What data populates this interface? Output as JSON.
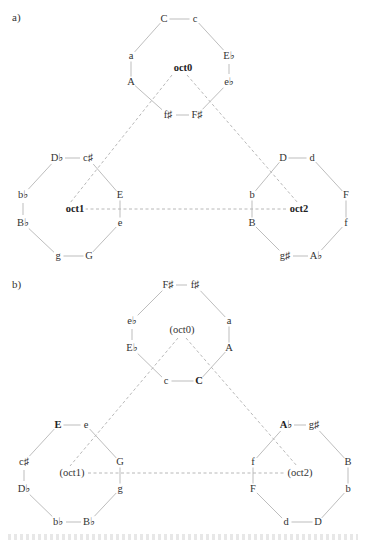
{
  "panels": [
    {
      "id": "a",
      "label": "a)",
      "label_pos": [
        12,
        18
      ],
      "hub_lines_dashed": true,
      "octagons": [
        {
          "name": "oct0",
          "center_label": "oct0",
          "center_bold": true,
          "center": [
            183,
            68
          ],
          "nodes": [
            {
              "t": "C",
              "x": 164,
              "y": 19,
              "bold": false
            },
            {
              "t": "c",
              "x": 195,
              "y": 19,
              "bold": false
            },
            {
              "t": "E♭",
              "x": 229,
              "y": 56,
              "bold": false
            },
            {
              "t": "e♭",
              "x": 229,
              "y": 82,
              "bold": false
            },
            {
              "t": "F♯",
              "x": 197,
              "y": 115,
              "bold": false
            },
            {
              "t": "f♯",
              "x": 168,
              "y": 115,
              "bold": false
            },
            {
              "t": "A",
              "x": 131,
              "y": 82,
              "bold": false
            },
            {
              "t": "a",
              "x": 131,
              "y": 56,
              "bold": false
            }
          ]
        },
        {
          "name": "oct1",
          "center_label": "oct1",
          "center_bold": true,
          "center": [
            75,
            209
          ],
          "nodes": [
            {
              "t": "D♭",
              "x": 57,
              "y": 158,
              "bold": false
            },
            {
              "t": "c♯",
              "x": 88,
              "y": 158,
              "bold": false
            },
            {
              "t": "E",
              "x": 120,
              "y": 195,
              "bold": false
            },
            {
              "t": "e",
              "x": 120,
              "y": 223,
              "bold": false
            },
            {
              "t": "G",
              "x": 89,
              "y": 256,
              "bold": false
            },
            {
              "t": "g",
              "x": 58,
              "y": 256,
              "bold": false
            },
            {
              "t": "B♭",
              "x": 23,
              "y": 223,
              "bold": false
            },
            {
              "t": "b♭",
              "x": 23,
              "y": 195,
              "bold": false
            }
          ]
        },
        {
          "name": "oct2",
          "center_label": "oct2",
          "center_bold": true,
          "center": [
            299,
            209
          ],
          "nodes": [
            {
              "t": "D",
              "x": 283,
              "y": 158,
              "bold": false
            },
            {
              "t": "d",
              "x": 312,
              "y": 158,
              "bold": false
            },
            {
              "t": "F",
              "x": 346,
              "y": 195,
              "bold": false
            },
            {
              "t": "f",
              "x": 346,
              "y": 223,
              "bold": false
            },
            {
              "t": "A♭",
              "x": 316,
              "y": 256,
              "bold": false
            },
            {
              "t": "g♯",
              "x": 285,
              "y": 256,
              "bold": false
            },
            {
              "t": "B",
              "x": 252,
              "y": 223,
              "bold": false
            },
            {
              "t": "b",
              "x": 252,
              "y": 195,
              "bold": false
            }
          ]
        }
      ],
      "dashed_links": [
        {
          "from": [
            172,
            75
          ],
          "to": [
            70,
            203
          ]
        },
        {
          "from": [
            187,
            75
          ],
          "to": [
            298,
            203
          ]
        },
        {
          "from": [
            85,
            209
          ],
          "to": [
            286,
            209
          ]
        }
      ]
    },
    {
      "id": "b",
      "label": "b)",
      "label_pos": [
        12,
        285
      ],
      "hub_lines_dashed": true,
      "octagons": [
        {
          "name": "oct0",
          "center_label": "(oct0)",
          "center_bold": false,
          "center": [
            182,
            330
          ],
          "nodes": [
            {
              "t": "F♯",
              "x": 168,
              "y": 285,
              "bold": false
            },
            {
              "t": "f♯",
              "x": 195,
              "y": 285,
              "bold": false
            },
            {
              "t": "a",
              "x": 229,
              "y": 321,
              "bold": false
            },
            {
              "t": "A",
              "x": 229,
              "y": 348,
              "bold": false
            },
            {
              "t": "C",
              "x": 199,
              "y": 381,
              "bold": true
            },
            {
              "t": "c",
              "x": 166,
              "y": 381,
              "bold": false
            },
            {
              "t": "E♭",
              "x": 132,
              "y": 348,
              "bold": false
            },
            {
              "t": "e♭",
              "x": 132,
              "y": 321,
              "bold": false
            }
          ]
        },
        {
          "name": "oct1",
          "center_label": "(oct1)",
          "center_bold": false,
          "center": [
            72,
            473
          ],
          "nodes": [
            {
              "t": "E",
              "x": 58,
              "y": 425,
              "bold": true
            },
            {
              "t": "e",
              "x": 86,
              "y": 425,
              "bold": false
            },
            {
              "t": "G",
              "x": 120,
              "y": 462,
              "bold": false
            },
            {
              "t": "g",
              "x": 120,
              "y": 489,
              "bold": false
            },
            {
              "t": "B♭",
              "x": 89,
              "y": 522,
              "bold": false
            },
            {
              "t": "b♭",
              "x": 58,
              "y": 522,
              "bold": false
            },
            {
              "t": "D♭",
              "x": 24,
              "y": 489,
              "bold": false
            },
            {
              "t": "c♯",
              "x": 24,
              "y": 462,
              "bold": false
            }
          ]
        },
        {
          "name": "oct2",
          "center_label": "(oct2)",
          "center_bold": false,
          "center": [
            300,
            473
          ],
          "nodes": [
            {
              "t": "A♭",
              "x": 286,
              "y": 425,
              "bold": true
            },
            {
              "t": "g♯",
              "x": 314,
              "y": 425,
              "bold": false
            },
            {
              "t": "B",
              "x": 348,
              "y": 462,
              "bold": false
            },
            {
              "t": "b",
              "x": 348,
              "y": 489,
              "bold": false
            },
            {
              "t": "D",
              "x": 318,
              "y": 522,
              "bold": false
            },
            {
              "t": "d",
              "x": 286,
              "y": 522,
              "bold": false
            },
            {
              "t": "F",
              "x": 253,
              "y": 489,
              "bold": false
            },
            {
              "t": "f",
              "x": 253,
              "y": 462,
              "bold": false
            }
          ]
        }
      ],
      "dashed_links": [
        {
          "from": [
            178,
            338
          ],
          "to": [
            70,
            466
          ]
        },
        {
          "from": [
            186,
            338
          ],
          "to": [
            297,
            466
          ]
        },
        {
          "from": [
            88,
            473
          ],
          "to": [
            286,
            473
          ]
        }
      ]
    }
  ],
  "colors": {
    "edge": "#b5b5b5",
    "dashed": "#b0b0b0",
    "text": "#333333"
  }
}
